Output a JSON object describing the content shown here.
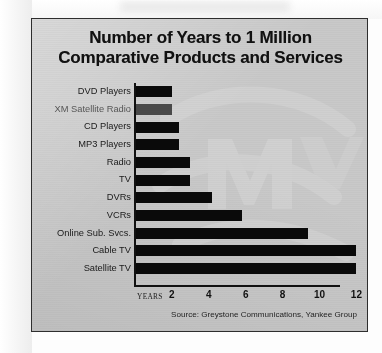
{
  "credit": {
    "text": "© PR NEWSFOTO/XM SATELLITE RADIO"
  },
  "panel": {
    "background_color": "#c9c9c9",
    "border_color": "#2e2e2e"
  },
  "title": {
    "line1": "Number of Years to 1 Million",
    "line2": "Comparative Products and Services"
  },
  "axis": {
    "years_label": "YEARS"
  },
  "source": {
    "text": "Source: Greystone Communications, Yankee Group"
  },
  "chart_data": {
    "type": "bar",
    "orientation": "horizontal",
    "title": "Number of Years to 1 Million Comparative Products and Services",
    "xlabel": "YEARS",
    "ylabel": "",
    "xlim": [
      0,
      12.6
    ],
    "xticks": [
      2,
      4,
      6,
      8,
      10,
      12
    ],
    "xtick_labels": [
      "2",
      "4",
      "6",
      "8",
      "10",
      "12"
    ],
    "grid": false,
    "legend": false,
    "bar_color": "#0a0a0a",
    "highlight_color": "#4a4a4a",
    "note": "Bar values read off the YEARS axis; XM Satellite Radio bar is rendered in gray to highlight it.",
    "categories": [
      "DVD Players",
      "XM Satellite Radio",
      "CD Players",
      "MP3 Players",
      "Radio",
      "TV",
      "DVRs",
      "VCRs",
      "Online Sub. Svcs.",
      "Cable TV",
      "Satellite TV"
    ],
    "values": [
      2,
      2,
      2.4,
      2.4,
      3,
      3,
      4.2,
      5.8,
      9.4,
      12,
      12
    ],
    "bars": [
      {
        "label": "DVD Players",
        "value": 2,
        "color": "#0a0a0a",
        "highlight": false
      },
      {
        "label": "XM Satellite Radio",
        "value": 2,
        "color": "#4a4a4a",
        "highlight": true
      },
      {
        "label": "CD Players",
        "value": 2.4,
        "color": "#0a0a0a",
        "highlight": false
      },
      {
        "label": "MP3 Players",
        "value": 2.4,
        "color": "#0a0a0a",
        "highlight": false
      },
      {
        "label": "Radio",
        "value": 3,
        "color": "#0a0a0a",
        "highlight": false
      },
      {
        "label": "TV",
        "value": 3,
        "color": "#0a0a0a",
        "highlight": false
      },
      {
        "label": "DVRs",
        "value": 4.2,
        "color": "#0a0a0a",
        "highlight": false
      },
      {
        "label": "VCRs",
        "value": 5.8,
        "color": "#0a0a0a",
        "highlight": false
      },
      {
        "label": "Online Sub. Svcs.",
        "value": 9.4,
        "color": "#0a0a0a",
        "highlight": false
      },
      {
        "label": "Cable TV",
        "value": 12,
        "color": "#0a0a0a",
        "highlight": false
      },
      {
        "label": "Satellite TV",
        "value": 12,
        "color": "#0a0a0a",
        "highlight": false
      }
    ]
  }
}
